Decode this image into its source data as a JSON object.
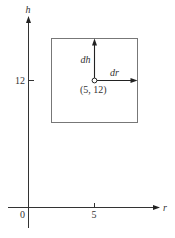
{
  "diagram": {
    "axes": {
      "x_label": "r",
      "y_label": "h",
      "origin_label": "0",
      "x_tick_label": "5",
      "y_tick_label": "12"
    },
    "point": {
      "label": "(5, 12)",
      "r": 5,
      "h": 12
    },
    "vectors": [
      {
        "name": "dh",
        "label": "dh",
        "direction": "up"
      },
      {
        "name": "dr",
        "label": "dr",
        "direction": "right"
      }
    ],
    "region": {
      "shape": "rectangle",
      "description": "neighborhood box around point (5, 12)"
    },
    "colors": {
      "axis": "#333333",
      "box": "#777777",
      "vector": "#222222",
      "text": "#333333",
      "background": "#ffffff"
    }
  }
}
